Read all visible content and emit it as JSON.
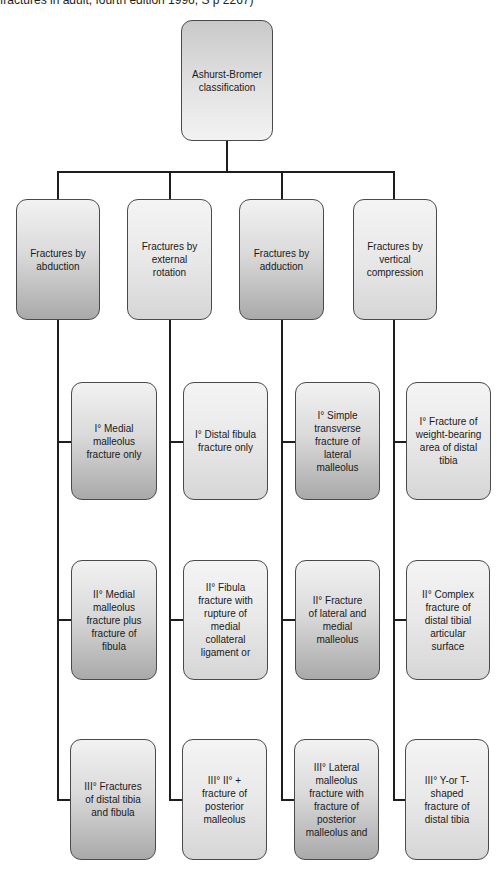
{
  "caption": "fractures in adult, fourth edition 1996, S p 2267)",
  "root": {
    "label": "Ashurst-Bromer classification"
  },
  "categories": [
    {
      "label": "Fractures by abduction",
      "style": "dark",
      "grades": [
        "I° Medial malleolus fracture only",
        "II° Medial malleolus fracture plus fracture of fibula",
        "III° Fractures of distal tibia and fibula"
      ]
    },
    {
      "label": "Fractures by external rotation",
      "style": "light",
      "grades": [
        "I° Distal fibula fracture only",
        "II° Fibula fracture with rupture of medial collateral ligament or",
        "III° II° + fracture of posterior malleolus"
      ]
    },
    {
      "label": "Fractures by adduction",
      "style": "dark",
      "grades": [
        "I° Simple transverse fracture of lateral malleolus",
        "II° Fracture of lateral and medial malleolus",
        "III° Lateral malleolus fracture with fracture of posterior malleolus and"
      ]
    },
    {
      "label": "Fractures by vertical compression",
      "style": "light",
      "grades": [
        "I° Fracture of weight-bearing area of distal tibia",
        "II° Complex fracture of distal tibial articular surface",
        "III° Y-or T-shaped fracture of distal tibia"
      ]
    }
  ],
  "colors": {
    "line": "#1e1e1e",
    "border": "#4a4a4a",
    "dark_bottom": "#a9a9a9",
    "light_bottom": "#d6d6d6"
  }
}
